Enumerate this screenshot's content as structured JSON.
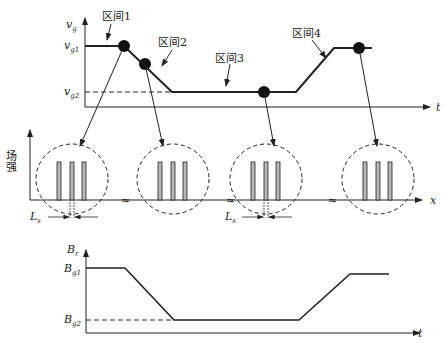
{
  "top_chart": {
    "y_label": "v",
    "y_label_sub": "g",
    "x_label": "t",
    "level_high": "v",
    "level_high_sub": "g1",
    "level_low": "v",
    "level_low_sub": "g2",
    "intervals": [
      "区间1",
      "区间2",
      "区间3",
      "区间4"
    ]
  },
  "middle_chart": {
    "y_label": "场强",
    "x_label": "x",
    "spacing_label": "L",
    "spacing_label_sub": "s",
    "break_symbol": "≈"
  },
  "bottom_chart": {
    "y_label": "B",
    "y_label_sub": "r",
    "x_label": "t",
    "level_high": "B",
    "level_high_sub": "g1",
    "level_low": "B",
    "level_low_sub": "g2"
  },
  "colors": {
    "line": "#222222",
    "bar_fill": "#b8b8b8"
  }
}
